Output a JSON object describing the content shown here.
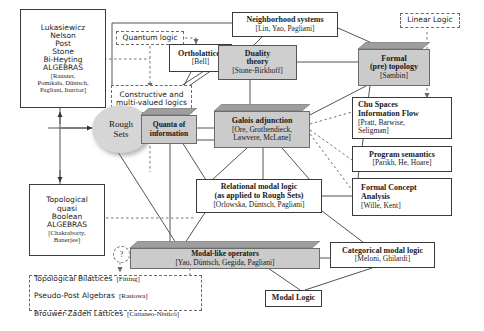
{
  "diagram": {
    "colors": {
      "shaded_node": "#cbcbcb",
      "ellipse": "#d6d6d6",
      "line": "#555555",
      "dashed_line": "#777777"
    },
    "nodes": {
      "algebras_left": {
        "lines": [
          "Lukasiewicz",
          "Nelson",
          "Post",
          "Stone",
          "Bi-Heyting",
          "ALGEBRAS"
        ],
        "refs": [
          "[Rauszer,",
          "Pomikała, Düntsch,",
          "Pagliani, Iturrioz]"
        ]
      },
      "quantum_logic": {
        "label": "Quantum logic"
      },
      "ortholattices": {
        "label": "Ortholattices",
        "ref": "[Bell]"
      },
      "constructive_logics": {
        "line1": "Constructive and",
        "line2": "multi-valued logics"
      },
      "neighborhood_systems": {
        "label": "Neighborhood systems",
        "ref": "[Lin, Yao, Pagliani]"
      },
      "linear_logic": {
        "label": "Linear Logic"
      },
      "duality_theory": {
        "line1": "Duality",
        "line2": "theory",
        "ref": "[Stone-Birkhoff]"
      },
      "formal_topology": {
        "line1": "Formal",
        "line2": "(pre) topology",
        "ref": "[Sambin]"
      },
      "chu_spaces": {
        "line1": "Chu Spaces",
        "line2": "Information Flow",
        "ref1": "[Pratt, Barwise,",
        "ref2": "Seligman]"
      },
      "program_semantics": {
        "label": "Program semantics",
        "ref": "[Parikh, He, Hoare]"
      },
      "formal_concept_analysis": {
        "line1": "Formal Concept",
        "line2": "Analysis",
        "ref": "[Wille, Kent]"
      },
      "rough_sets": {
        "line1": "Rough",
        "line2": "Sets"
      },
      "quanta_of_information": {
        "line1": "Quanta of",
        "line2": "information"
      },
      "galois_adjunction": {
        "label": "Galois adjunction",
        "ref1": "[Ore, Grothendieck,",
        "ref2": "Lawvere, McLane]"
      },
      "relational_modal_logic": {
        "line1": "Relational modal logic",
        "line2": "(as applied to Rough Sets)",
        "ref": "[Orlowska, Düntsch, Pagliani]"
      },
      "topological_quasi_boolean": {
        "lines": [
          "Topological",
          "quasi",
          "Boolean",
          "ALGEBRAS"
        ],
        "ref1": "[Chakraborty,",
        "ref2": "Banerjee]"
      },
      "modal_like_operators": {
        "label": "Modal-like operators",
        "ref": "[Yao, Düntsch, Gegida, Pagliani]"
      },
      "question_mark": {
        "label": "?"
      },
      "categorical_modal_logic": {
        "label": "Categorical modal logic",
        "ref": "[Meloni, Ghilardi]"
      },
      "lattices_list": {
        "items": [
          {
            "name": "Topological Bilattices",
            "ref": "[Fitting]"
          },
          {
            "name": "Pseudo-Post Algebras",
            "ref": "[Rasiowa]"
          },
          {
            "name": "Brouwer-Zadeh Lattices",
            "ref": "[Cattaneo-Nisticò]"
          }
        ]
      },
      "modal_logic": {
        "label": "Modal Logic"
      }
    }
  }
}
